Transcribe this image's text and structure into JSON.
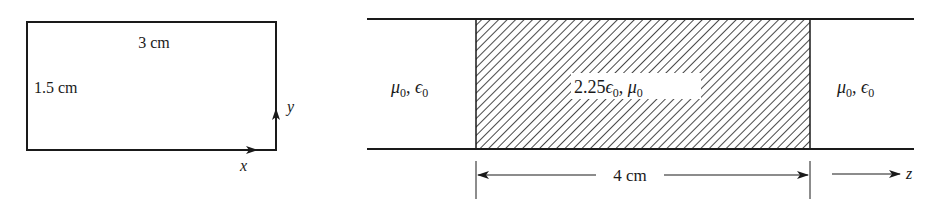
{
  "cross_section": {
    "width_label": "3 cm",
    "height_label": "1.5 cm",
    "axis_x_label": "x",
    "axis_y_label": "y"
  },
  "waveguide": {
    "left_region": {
      "mu": "μ",
      "mu_sub": "0",
      "sep": ", ",
      "eps": "ϵ",
      "eps_sub": "0"
    },
    "center_region": {
      "coef": "2.25",
      "eps": "ϵ",
      "eps_sub": "0",
      "sep": ", ",
      "mu": "μ",
      "mu_sub": "0"
    },
    "right_region": {
      "mu": "μ",
      "mu_sub": "0",
      "sep": ", ",
      "eps": "ϵ",
      "eps_sub": "0"
    },
    "length_label": "4 cm",
    "propagation_axis_label": "z"
  },
  "colors": {
    "line": "#1a1a1a",
    "background": "#ffffff"
  }
}
